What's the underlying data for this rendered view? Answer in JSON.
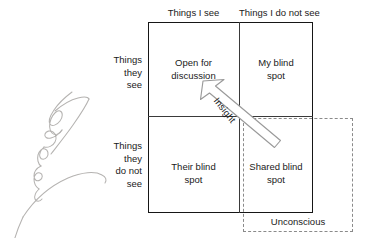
{
  "diagram": {
    "type": "johari-window",
    "columns": [
      {
        "id": "i-see",
        "label": "Things I see"
      },
      {
        "id": "i-do-not-see",
        "label": "Things I do not see"
      }
    ],
    "rows": [
      {
        "id": "they-see",
        "lines": [
          "Things",
          "they",
          "see"
        ]
      },
      {
        "id": "they-do-not-see",
        "lines": [
          "Things",
          "they",
          "do not",
          "see"
        ]
      }
    ],
    "quadrants": [
      {
        "id": "open-for-discussion",
        "lines": [
          "Open for",
          "discussion"
        ]
      },
      {
        "id": "my-blind-spot",
        "lines": [
          "My blind",
          "spot"
        ]
      },
      {
        "id": "their-blind-spot",
        "lines": [
          "Their blind",
          "spot"
        ]
      },
      {
        "id": "shared-blind-spot",
        "lines": [
          "Shared blind",
          "spot"
        ]
      }
    ],
    "arrow": {
      "id": "insight-arrow",
      "label": "Insight",
      "from": "shared-blind-spot",
      "to": "open-for-discussion"
    },
    "unconscious": {
      "id": "unconscious",
      "label": "Unconscious"
    },
    "annotation": {
      "id": "signature",
      "label": "handwritten-signature"
    },
    "colors": {
      "border": "#161616",
      "divider": "#3a3a3a",
      "dashed": "#8a8a8a",
      "text": "#1a1a1a",
      "arrow_stroke": "#9a9a9a",
      "signature": "#b4b2b0",
      "background": "#ffffff"
    }
  }
}
